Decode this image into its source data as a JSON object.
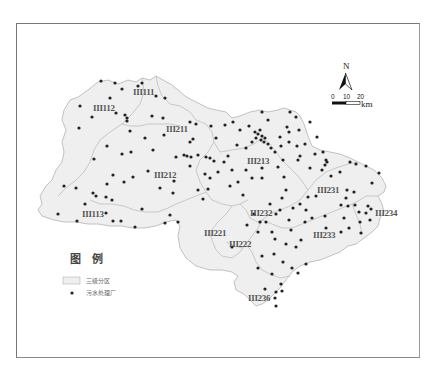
{
  "map": {
    "zones": [
      {
        "id": "III111",
        "label": "III111",
        "x": 163,
        "y": 92
      },
      {
        "id": "III112",
        "label": "III112",
        "x": 93,
        "y": 108
      },
      {
        "id": "III211",
        "label": "III211",
        "x": 166,
        "y": 129
      },
      {
        "id": "III212",
        "label": "III212",
        "x": 154,
        "y": 175
      },
      {
        "id": "III213",
        "label": "III213",
        "x": 247,
        "y": 161
      },
      {
        "id": "III113",
        "label": "III113",
        "x": 83,
        "y": 216
      },
      {
        "id": "III231",
        "label": "III231",
        "x": 317,
        "y": 190
      },
      {
        "id": "III232",
        "label": "III232",
        "x": 250,
        "y": 215
      },
      {
        "id": "III234",
        "label": "III234",
        "x": 374,
        "y": 214
      },
      {
        "id": "III221",
        "label": "III221",
        "x": 203,
        "y": 236
      },
      {
        "id": "III233",
        "label": "III233",
        "x": 313,
        "y": 237
      },
      {
        "id": "III222",
        "label": "III222",
        "x": 229,
        "y": 246
      },
      {
        "id": "III236",
        "label": "III236",
        "x": 248,
        "y": 301
      }
    ],
    "zone_fill": "#efefef",
    "zone_stroke": "#b0b0b0",
    "point_color": "#222222"
  },
  "legend": {
    "title": "图　例",
    "items": [
      {
        "symbol": "polygon",
        "label": "三级分区"
      },
      {
        "symbol": "point",
        "label": "污水处理厂"
      }
    ]
  },
  "north_arrow": {
    "label": "N"
  },
  "scale_bar": {
    "ticks": [
      "0",
      "10",
      "20"
    ],
    "unit": "km"
  }
}
